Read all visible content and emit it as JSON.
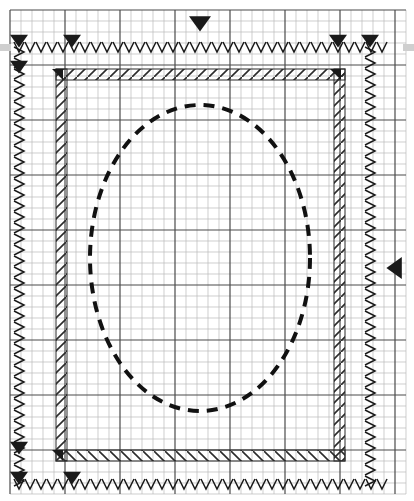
{
  "canvas": {
    "width": 414,
    "height": 501,
    "background_color": "#ffffff",
    "title": "Mesh Boundary Condition Canvas"
  },
  "grid": {
    "origin_x": 10,
    "origin_y": 10,
    "cols": 36,
    "rows": 44,
    "cell_size": 11,
    "minor_color": "#b9b9b9",
    "major_color": "#4a4a4a",
    "major_every": 5,
    "visible": true
  },
  "geometry": {
    "ellipse": {
      "label": "part-outline",
      "center_x": 200,
      "center_y": 258,
      "radius_x": 110,
      "radius_y": 153,
      "stroke_color": "#111111",
      "stroke_width": 4,
      "dash": "11 8",
      "style": "dashed"
    }
  },
  "boundaries": {
    "constraint_color": "#1a1a1a",
    "hatch_color": "#2b2b2b",
    "v_marker_label": "V",
    "v_marker_pitch": 11,
    "edges": [
      {
        "name": "top-constraint-row",
        "orientation": "horizontal",
        "x1": 14,
        "x2": 386,
        "y": 47,
        "marker": "V"
      },
      {
        "name": "bottom-constraint-row",
        "orientation": "horizontal",
        "x1": 14,
        "x2": 386,
        "y": 484,
        "marker": "V"
      },
      {
        "name": "left-constraint-column",
        "orientation": "vertical",
        "y1": 47,
        "y2": 484,
        "x": 19,
        "marker": "V"
      },
      {
        "name": "right-constraint-column",
        "orientation": "vertical",
        "y1": 47,
        "y2": 484,
        "x": 370,
        "marker": "V"
      }
    ],
    "hatch_bands": [
      {
        "name": "top-hatch-band",
        "orientation": "horizontal",
        "x": 56,
        "y": 69,
        "length": 289,
        "thickness": 11,
        "slope": "up"
      },
      {
        "name": "bottom-hatch-band",
        "orientation": "horizontal",
        "x": 56,
        "y": 450,
        "length": 289,
        "thickness": 11,
        "slope": "down"
      },
      {
        "name": "left-hatch-band",
        "orientation": "vertical",
        "x": 56,
        "y": 69,
        "length": 392,
        "thickness": 11,
        "slope": "up"
      },
      {
        "name": "right-hatch-band",
        "orientation": "vertical",
        "x": 334,
        "y": 69,
        "length": 392,
        "thickness": 11,
        "slope": "up"
      }
    ]
  },
  "markers": {
    "triangles": [
      {
        "name": "top-center-load-marker",
        "direction": "down",
        "x": 200,
        "y": 25,
        "size": 11
      },
      {
        "name": "right-middle-load-marker",
        "direction": "left",
        "x": 393,
        "y": 268,
        "size": 11
      },
      {
        "name": "top-left-constraint-marker",
        "direction": "down",
        "x": 19,
        "y": 42,
        "size": 9
      },
      {
        "name": "top-band-constraint-marker",
        "direction": "down",
        "x": 72,
        "y": 42,
        "size": 9
      },
      {
        "name": "top-right-band-constraint-marker",
        "direction": "down",
        "x": 338,
        "y": 42,
        "size": 9
      },
      {
        "name": "top-right-constraint-marker",
        "direction": "down",
        "x": 370,
        "y": 42,
        "size": 9
      },
      {
        "name": "bottom-left-constraint-marker",
        "direction": "down",
        "x": 19,
        "y": 479,
        "size": 9
      },
      {
        "name": "bottom-band-constraint-marker",
        "direction": "down",
        "x": 72,
        "y": 479,
        "size": 9
      },
      {
        "name": "left-hatch-corner-marker",
        "direction": "down",
        "x": 19,
        "y": 68,
        "size": 9
      },
      {
        "name": "left-hatch-corner-marker-lower",
        "direction": "down",
        "x": 19,
        "y": 449,
        "size": 9
      },
      {
        "name": "top-left-corner-wedge",
        "direction": "corner-left",
        "x": 63,
        "y": 69,
        "size": 11
      },
      {
        "name": "top-right-corner-wedge",
        "direction": "corner-left",
        "x": 341,
        "y": 69,
        "size": 11
      },
      {
        "name": "bottom-left-corner-wedge",
        "direction": "corner-left",
        "x": 63,
        "y": 450,
        "size": 11
      }
    ]
  },
  "scroll_indicators": [
    {
      "name": "left-scroll-handle",
      "x": 0,
      "y": 44,
      "width": 11,
      "height": 7,
      "color": "#cfcfcf"
    },
    {
      "name": "right-scroll-handle",
      "x": 403,
      "y": 44,
      "width": 11,
      "height": 7,
      "color": "#cfcfcf"
    }
  ]
}
